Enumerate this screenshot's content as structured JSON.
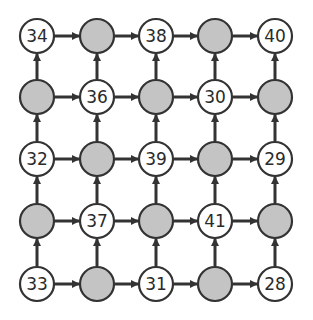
{
  "grid": {
    "rows": 5,
    "cols": 5,
    "col_centers": [
      37,
      97,
      156,
      215,
      275
    ],
    "row_centers": [
      36,
      97,
      159,
      221,
      284
    ],
    "radius": 17,
    "cells": [
      [
        "34",
        "",
        "38",
        "",
        "40"
      ],
      [
        "",
        "36",
        "",
        "30",
        ""
      ],
      [
        "32",
        "",
        "39",
        "",
        "29"
      ],
      [
        "",
        "37",
        "",
        "41",
        ""
      ],
      [
        "33",
        "",
        "31",
        "",
        "28"
      ]
    ]
  },
  "arrows": {
    "horizontal": "left-to-right between adjacent nodes in every row",
    "vertical": "bottom-to-top between adjacent nodes in every column"
  },
  "colors": {
    "empty_fill": "#c4c4c4",
    "number_fill": "#ffffff",
    "stroke": "#333333",
    "arrow": "#333333"
  }
}
